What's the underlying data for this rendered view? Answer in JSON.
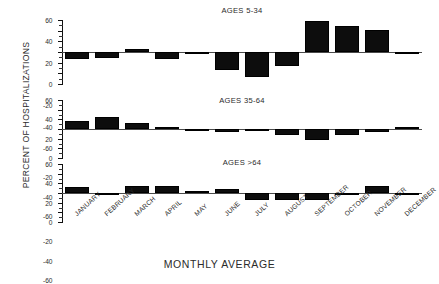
{
  "chart_data": {
    "type": "bar",
    "title": "",
    "xlabel": "MONTHLY AVERAGE",
    "ylabel": "PERCENT OF HOSPITALIZATIONS",
    "categories": [
      "JANUARY",
      "FEBRUARY",
      "MARCH",
      "APRIL",
      "MAY",
      "JUNE",
      "JULY",
      "AUGUST",
      "SEPTEMBER",
      "OCTOBER",
      "NOVEMBER",
      "DECEMBER"
    ],
    "ylim": [
      -60,
      60
    ],
    "yticks": [
      60,
      40,
      20,
      0,
      -20,
      -40,
      -60
    ],
    "ytick_labels": [
      "60",
      "40",
      "20",
      "0",
      "-20",
      "-40",
      "-60"
    ],
    "grid": false,
    "legend": "none",
    "panels": [
      {
        "title": "AGES 5-34",
        "values": [
          -13,
          -12,
          5,
          -14,
          -1,
          -33,
          -47,
          -27,
          58,
          48,
          41,
          -2
        ]
      },
      {
        "title": "AGES 35-64",
        "values": [
          17,
          25,
          13,
          4,
          -1,
          -6,
          -5,
          -13,
          -23,
          -12,
          -6,
          4
        ]
      },
      {
        "title": "AGES >64",
        "values": [
          12,
          -4,
          14,
          14,
          2,
          9,
          -14,
          -14,
          -14,
          -5,
          15,
          -2
        ]
      }
    ]
  }
}
